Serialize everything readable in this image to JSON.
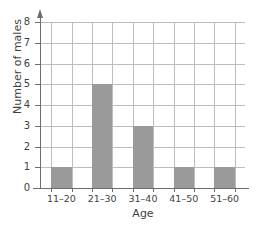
{
  "chart_data": {
    "type": "bar",
    "title": "",
    "xlabel": "Age",
    "ylabel": "Number of males",
    "categories": [
      "11–20",
      "21–30",
      "31–40",
      "41–50",
      "51–60"
    ],
    "values": [
      1,
      5,
      3,
      1,
      1
    ],
    "ylim": [
      0,
      8
    ],
    "ytick_labels": [
      "0",
      "1",
      "2",
      "3",
      "4",
      "5",
      "6",
      "7",
      "8"
    ],
    "yticks": [
      0,
      1,
      2,
      3,
      4,
      5,
      6,
      7,
      8
    ],
    "grid": true,
    "legend": "none",
    "bar_color": "#9a9a9a",
    "grid_color": "#bdbdbd",
    "axis_color": "#6e6e6e",
    "background_color": "#ffffff"
  }
}
